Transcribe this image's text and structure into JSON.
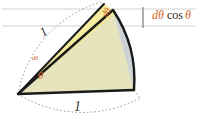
{
  "figure": {
    "name": "circular-sector-differential-area-diagram",
    "colors": {
      "triangle_fill": "#e6e4bd",
      "segment_fill": "#ccd2d6",
      "differential_fill": "#f5e98c",
      "stroke": "#1a1a1a",
      "dashed": "#8c8a86",
      "accent": "#d4662a",
      "guide_line": "#c9c9c9",
      "background": "#ffffff"
    },
    "labels": {
      "radius_upper": "1",
      "radius_lower": "1",
      "theta": "θ",
      "dtheta_origin": "dθ",
      "dtheta_apex": "dθ",
      "projection_d": "dθ",
      "projection_cos": "cos",
      "projection_theta": "θ"
    },
    "geometry": {
      "origin": [
        18,
        94
      ],
      "radius": 118,
      "angle_start_deg": -2,
      "angle_sector_deg": 58,
      "chord_endpoint": [
        113,
        10
      ],
      "arc_endpoint": [
        134,
        90
      ],
      "bracket_x": 143,
      "bracket_top": 7,
      "bracket_bottom": 28,
      "guide_line_y_top": 9,
      "guide_line_y_bottom": 26
    }
  }
}
